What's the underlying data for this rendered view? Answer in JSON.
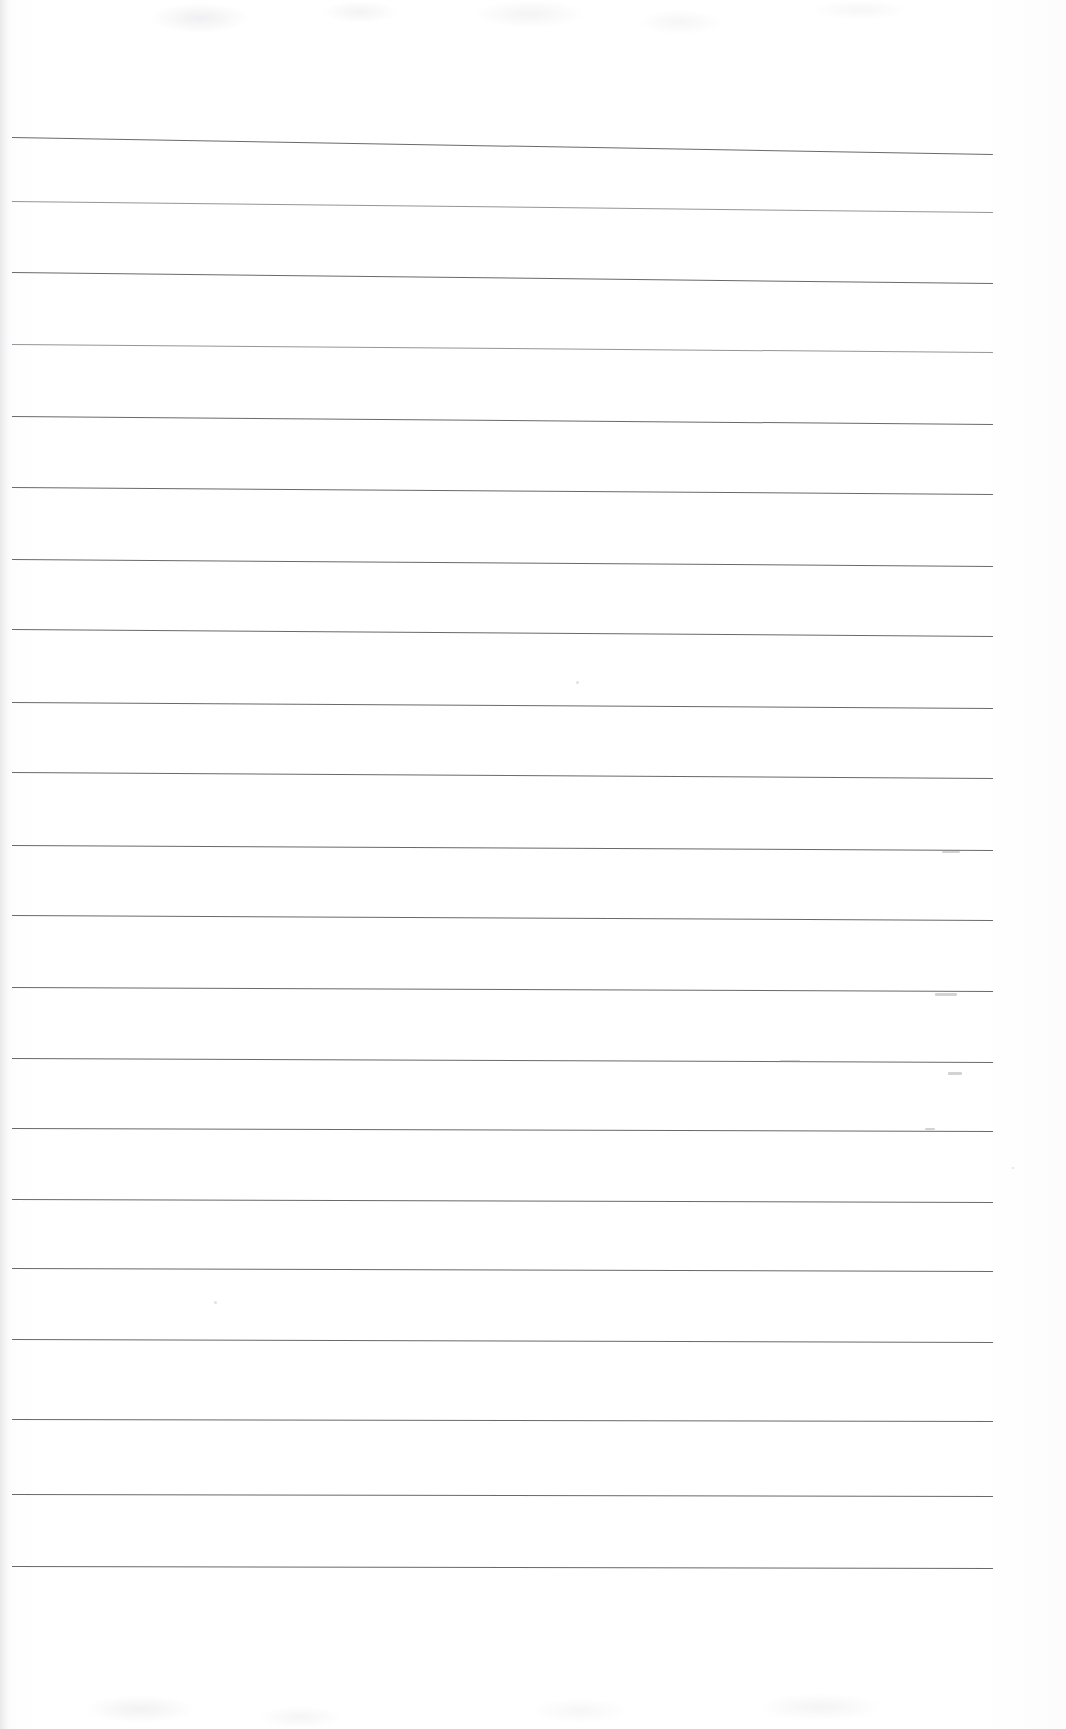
{
  "document": {
    "kind": "scanned-blank-lined-page",
    "title": "Blank lined notebook page (scan)",
    "background_color": "#ffffff",
    "rule_color": "#5c5c60",
    "page_width": 1066,
    "page_height": 1729,
    "text_content": "",
    "visible_text": []
  },
  "ruling": {
    "line_count": 21,
    "left_x": 12,
    "right_x": 993,
    "spacing_px": 70,
    "first_line_y": 137,
    "slope_px_over_width": 17,
    "lines": [
      {
        "index": 1,
        "y_left": 137,
        "y_right": 154,
        "weight": "normal"
      },
      {
        "index": 2,
        "y_left": 201,
        "y_right": 212,
        "weight": "faint"
      },
      {
        "index": 3,
        "y_left": 272,
        "y_right": 283,
        "weight": "normal"
      },
      {
        "index": 4,
        "y_left": 344,
        "y_right": 352,
        "weight": "faint"
      },
      {
        "index": 5,
        "y_left": 416,
        "y_right": 424,
        "weight": "normal"
      },
      {
        "index": 6,
        "y_left": 487,
        "y_right": 494,
        "weight": "normal"
      },
      {
        "index": 7,
        "y_left": 559,
        "y_right": 566,
        "weight": "normal"
      },
      {
        "index": 8,
        "y_left": 629,
        "y_right": 636,
        "weight": "normal"
      },
      {
        "index": 9,
        "y_left": 702,
        "y_right": 708,
        "weight": "normal"
      },
      {
        "index": 10,
        "y_left": 772,
        "y_right": 778,
        "weight": "normal"
      },
      {
        "index": 11,
        "y_left": 845,
        "y_right": 850,
        "weight": "normal"
      },
      {
        "index": 12,
        "y_left": 915,
        "y_right": 920,
        "weight": "normal"
      },
      {
        "index": 13,
        "y_left": 987,
        "y_right": 991,
        "weight": "normal"
      },
      {
        "index": 14,
        "y_left": 1058,
        "y_right": 1062,
        "weight": "normal"
      },
      {
        "index": 15,
        "y_left": 1128,
        "y_right": 1131,
        "weight": "normal"
      },
      {
        "index": 16,
        "y_left": 1199,
        "y_right": 1202,
        "weight": "normal"
      },
      {
        "index": 17,
        "y_left": 1268,
        "y_right": 1271,
        "weight": "normal"
      },
      {
        "index": 18,
        "y_left": 1339,
        "y_right": 1342,
        "weight": "normal"
      },
      {
        "index": 19,
        "y_left": 1419,
        "y_right": 1421,
        "weight": "normal"
      },
      {
        "index": 20,
        "y_left": 1494,
        "y_right": 1496,
        "weight": "normal"
      },
      {
        "index": 21,
        "y_left": 1566,
        "y_right": 1568,
        "weight": "normal"
      }
    ]
  },
  "artifacts": {
    "description": "faint scanner / pencil marks visible on the page",
    "margin_marks": [
      {
        "x": 942,
        "y": 851,
        "w": 18,
        "h": 2,
        "label": "faint-dash-right-margin-1"
      },
      {
        "x": 935,
        "y": 993,
        "w": 22,
        "h": 3,
        "label": "faint-dash-right-margin-2"
      },
      {
        "x": 948,
        "y": 1072,
        "w": 14,
        "h": 3,
        "label": "faint-dash-right-margin-3"
      },
      {
        "x": 780,
        "y": 1060,
        "w": 20,
        "h": 2,
        "label": "faint-dash-mid-page"
      },
      {
        "x": 925,
        "y": 1128,
        "w": 10,
        "h": 2,
        "label": "faint-dash-right-margin-4"
      }
    ],
    "specks": [
      {
        "x": 576,
        "y": 681,
        "d": 3
      },
      {
        "x": 214,
        "y": 1301,
        "d": 3
      },
      {
        "x": 1012,
        "y": 1167,
        "d": 2
      }
    ]
  }
}
